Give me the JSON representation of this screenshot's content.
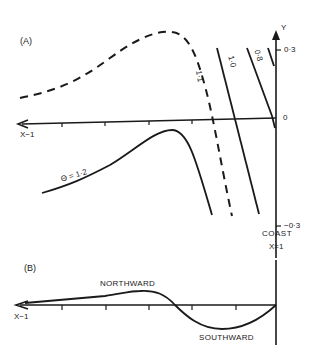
{
  "panel_a": {
    "label": "(A)",
    "x_axis_label": "X−1",
    "y_axis_label": "Y",
    "y_ticks": {
      "top": "0·3",
      "zero": "0",
      "bottom": "−0·3"
    },
    "coast_label": "COAST",
    "coast_x_label": "X=1",
    "curves": [
      {
        "label": "Θ = 1·2",
        "style": "solid"
      },
      {
        "label": "1·1",
        "style": "dashed"
      },
      {
        "label": "1·0",
        "style": "solid"
      },
      {
        "label": "0·8",
        "style": "solid"
      }
    ]
  },
  "panel_b": {
    "label": "(B)",
    "x_axis_label": "X−1",
    "northward_label": "NORTHWARD",
    "southward_label": "SOUTHWARD"
  },
  "colors": {
    "ink": "#1a1a1a",
    "background": "#ffffff"
  }
}
